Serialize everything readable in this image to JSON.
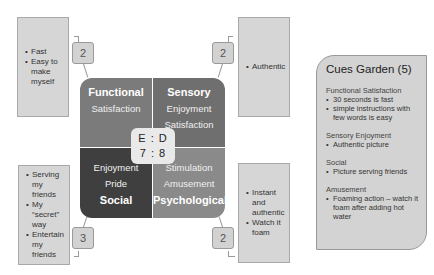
{
  "quadrants": {
    "functional": {
      "title": "Functional",
      "items": [
        "Satisfaction"
      ],
      "color": "#7b7b7b"
    },
    "sensory": {
      "title": "Sensory",
      "items": [
        "Enjoyment",
        "Satisfaction"
      ],
      "color": "#6f6f6f"
    },
    "social": {
      "title": "Social",
      "items": [
        "Enjoyment",
        "Pride"
      ],
      "color": "#3f3f3f"
    },
    "psychological": {
      "title": "Psychological",
      "items": [
        "Stimulation",
        "Amusement"
      ],
      "color": "#8a8a8a"
    }
  },
  "ratio": {
    "labels": "E : D",
    "values": "7 : 8"
  },
  "notes": {
    "top_left": {
      "badge": "2",
      "items": [
        "Fast",
        "Easy to make myself"
      ]
    },
    "top_right": {
      "badge": "2",
      "items": [
        "Authentic"
      ]
    },
    "bottom_left": {
      "badge": "3",
      "items": [
        "Serving my friends",
        "My “secret” way",
        "Entertain my friends"
      ]
    },
    "bottom_right": {
      "badge": "2",
      "items": [
        "Instant and authentic",
        "Watch it foam"
      ]
    }
  },
  "garden": {
    "title": "Cues Garden (5)",
    "sections": [
      {
        "title": "Functional Satisfaction",
        "items": [
          "30 seconds is fast",
          "simple instructions with few words is easy"
        ]
      },
      {
        "title": "Sensory Enjoyment",
        "items": [
          "Authentic picture"
        ]
      },
      {
        "title": "Social",
        "items": [
          "Picture serving friends"
        ]
      },
      {
        "title": "Amusement",
        "items": [
          "Foaming action – watch it foam after adding hot water"
        ]
      }
    ]
  }
}
